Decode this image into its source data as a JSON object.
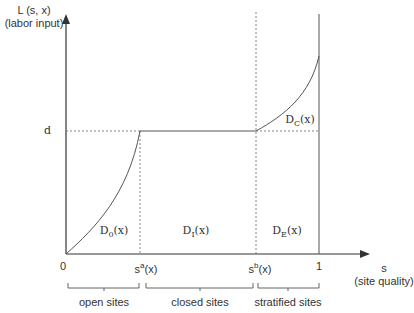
{
  "diagram": {
    "y_axis": {
      "label_line1": "L (s, x)",
      "label_line2": "(labor input)"
    },
    "x_axis": {
      "label_line1": "s",
      "label_line2": "(site quality)"
    },
    "y_tick": "d",
    "x_ticks": {
      "zero": "0",
      "sa": {
        "base": "s",
        "sup": "a",
        "suffix": "(x)"
      },
      "sb": {
        "base": "s",
        "sup": "b",
        "suffix": "(x)"
      },
      "one": "1"
    },
    "regions": {
      "d0": {
        "base": "D",
        "sub": "0",
        "suffix": "(x)"
      },
      "di": {
        "base": "D",
        "sub": "I",
        "suffix": "(x)"
      },
      "de": {
        "base": "D",
        "sub": "E",
        "suffix": "(x)"
      },
      "dc": {
        "base": "D",
        "sub": "C",
        "suffix": "(x)"
      }
    },
    "brackets": {
      "open": "open sites",
      "closed": "closed sites",
      "stratified": "stratified sites"
    },
    "colors": {
      "line": "#555555",
      "dotted": "#777777",
      "text": "#333333"
    }
  }
}
